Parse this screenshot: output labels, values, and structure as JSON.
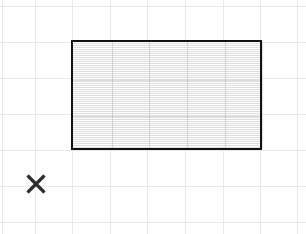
{
  "canvas": {
    "width": 306,
    "height": 234,
    "background_color": "#ffffff",
    "description": "Grid paper canvas with one filled rectangle and one X marker"
  },
  "grid": {
    "line_color": "#e9e9e9",
    "cell_width": 37.4,
    "cell_height": 36,
    "vertical_line_x": [
      2,
      35,
      72,
      110,
      147,
      185,
      223,
      260,
      297
    ],
    "horizontal_line_y": [
      6,
      42,
      78,
      114,
      150,
      186,
      222
    ]
  },
  "shapes": {
    "rectangle": {
      "name": "filled-rectangle",
      "x": 71,
      "y": 40,
      "width": 191,
      "height": 110,
      "border_color": "#111111",
      "border_width": 2.5,
      "fill_color": "#f3f3f3",
      "fill_texture": "horizontal-scanlines",
      "inner_vertical_line_x": [
        39,
        76,
        114,
        152,
        189
      ],
      "inner_horizontal_line_y": [
        38,
        74
      ]
    },
    "x_marker": {
      "name": "x-marker",
      "center_x": 36,
      "center_y": 184,
      "size": 22,
      "stroke_color": "#2e2e2e",
      "stroke_width": 3.2
    }
  }
}
